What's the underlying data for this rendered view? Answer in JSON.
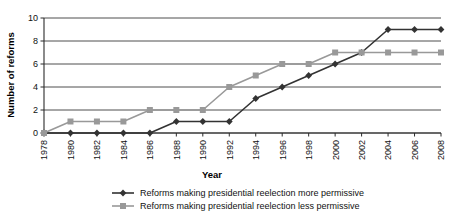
{
  "chart_data": {
    "type": "line",
    "title": "",
    "xlabel": "Year",
    "ylabel": "Number of reforms",
    "x": [
      1978,
      1980,
      1982,
      1984,
      1986,
      1988,
      1990,
      1992,
      1994,
      1996,
      1998,
      2000,
      2002,
      2004,
      2006,
      2008
    ],
    "xtick_labels": [
      "1978",
      "1980",
      "1982",
      "1984",
      "1986",
      "1988",
      "1990",
      "1992",
      "1994",
      "1996",
      "1998",
      "2000",
      "2002",
      "2004",
      "2006",
      "2008"
    ],
    "ytick_labels": [
      "0",
      "2",
      "4",
      "6",
      "8",
      "10"
    ],
    "yticks": [
      0,
      2,
      4,
      6,
      8,
      10
    ],
    "ylim": [
      0,
      10
    ],
    "xlim": [
      1978,
      2008
    ],
    "grid": "horizontal",
    "legend_position": "bottom",
    "series": [
      {
        "name": "Reforms making presidential reelection more permissive",
        "color": "#333333",
        "marker": "diamond",
        "values": [
          0,
          0,
          0,
          0,
          0,
          1,
          1,
          1,
          3,
          4,
          5,
          6,
          7,
          9,
          9,
          9
        ]
      },
      {
        "name": "Reforms making presidential reelection less permissive",
        "color": "#999999",
        "marker": "square",
        "values": [
          0,
          1,
          1,
          1,
          2,
          2,
          2,
          4,
          5,
          6,
          6,
          7,
          7,
          7,
          7,
          7
        ]
      }
    ]
  },
  "legend": {
    "items": [
      {
        "label": "Reforms making presidential reelection more permissive"
      },
      {
        "label": "Reforms making presidential reelection less permissive"
      }
    ]
  },
  "colors": {
    "series_more_permissive": "#333333",
    "series_less_permissive": "#999999",
    "axis": "#2b2b2b",
    "grid": "#3a3a3a",
    "background": "#ffffff"
  }
}
